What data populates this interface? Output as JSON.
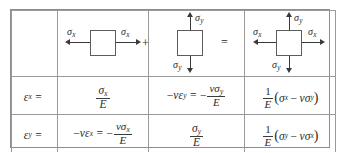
{
  "figure": {
    "kind": "stress-strain-superposition-table",
    "columns": 4,
    "rows": 3
  },
  "symbols": {
    "sigma": "σ",
    "epsilon": "ε",
    "nu": "ν",
    "E": "E",
    "minus": "−",
    "equals": "=",
    "plus": "+",
    "one": "1",
    "x": "x",
    "y": "y",
    "lparen": "(",
    "rparen": ")"
  },
  "row_diagram": {
    "label_col": "",
    "cell_sigma_x": {
      "name": "uniaxial-x-stress-element",
      "left_label": "σ",
      "left_sub": "x",
      "right_label": "σ",
      "right_sub": "x",
      "connector": "+"
    },
    "cell_sigma_y": {
      "name": "uniaxial-y-stress-element",
      "top_label": "σ",
      "top_sub": "y",
      "bottom_label": "σ",
      "bottom_sub": "y",
      "connector": "="
    },
    "cell_biaxial": {
      "name": "biaxial-stress-element",
      "left_label": "σ",
      "left_sub": "x",
      "right_label": "σ",
      "right_sub": "x",
      "top_label": "σ",
      "top_sub": "y",
      "bottom_label": "σ",
      "bottom_sub": "y"
    }
  },
  "row_epsilon_x": {
    "label": {
      "base": "ε",
      "sub": "x",
      "eq": "="
    },
    "term_1": {
      "text": "σx / E",
      "num_base": "σ",
      "num_sub": "x",
      "den": "E"
    },
    "term_2": {
      "text": "−νεy = −νσy / E",
      "lead_minus": "−",
      "nu": "ν",
      "eps_base": "ε",
      "eps_sub": "y",
      "eq": "=",
      "minus2": "−",
      "num_nu": "ν",
      "num_sigma": "σ",
      "num_sub": "y",
      "den": "E"
    },
    "term_3": {
      "text": "(1/E)(σx − νσy)",
      "num": "1",
      "den": "E",
      "lparen": "(",
      "a_base": "σ",
      "a_sub": "x",
      "minus": "−",
      "nu": "ν",
      "b_base": "σ",
      "b_sub": "y",
      "rparen": ")"
    }
  },
  "row_epsilon_y": {
    "label": {
      "base": "ε",
      "sub": "y",
      "eq": "="
    },
    "term_1": {
      "text": "−νεx = −νσx / E",
      "lead_minus": "−",
      "nu": "ν",
      "eps_base": "ε",
      "eps_sub": "x",
      "eq": "=",
      "minus2": "−",
      "num_nu": "ν",
      "num_sigma": "σ",
      "num_sub": "x",
      "den": "E"
    },
    "term_2": {
      "text": "σy / E",
      "num_base": "σ",
      "num_sub": "y",
      "den": "E"
    },
    "term_3": {
      "text": "(1/E)(σy − νσx)",
      "num": "1",
      "den": "E",
      "lparen": "(",
      "a_base": "σ",
      "a_sub": "y",
      "minus": "−",
      "nu": "ν",
      "b_base": "σ",
      "b_sub": "x",
      "rparen": ")"
    }
  },
  "colors": {
    "border": "#9a9a9a",
    "ink": "#2b2b2b",
    "arrow": "#3a3a3a",
    "background": "#ffffff"
  }
}
